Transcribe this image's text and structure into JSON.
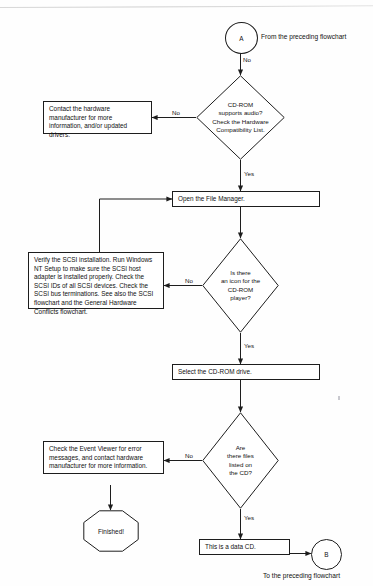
{
  "diagram": {
    "type": "flowchart",
    "ink_color": "#1d1d1d",
    "page_color": "#fefefe"
  },
  "connectors": {
    "entry": {
      "label": "A",
      "caption": "From the preceding flowchart"
    },
    "exit": {
      "label": "B",
      "caption": "To the preceding flowchart"
    }
  },
  "decisions": {
    "audio_support": {
      "lines": [
        "CD-ROM",
        "supports audio?",
        "Check the Hardware",
        "Compatibility List."
      ],
      "no_label": "No",
      "yes_label": "Yes"
    },
    "icon_present": {
      "lines": [
        "Is there",
        "an icon for the",
        "CD-ROM",
        "player?"
      ],
      "no_label": "No",
      "yes_label": "Yes"
    },
    "files_listed": {
      "lines": [
        "Are",
        "there files",
        "listed on",
        "the CD?"
      ],
      "no_label": "No",
      "yes_label": "Yes"
    }
  },
  "processes": {
    "contact_manufacturer": "Contact the hardware manufacturer for more information, and/or updated drivers.",
    "open_file_manager": "Open the File Manager.",
    "verify_scsi": "Verify the SCSI installation. Run Windows NT Setup to make sure the SCSI host adapter is installed properly. Check the SCSI IDs of all SCSI devices. Check the SCSI bus terminations. See also the SCSI flowchart and the General Hardware Conflicts flowchart.",
    "select_drive": "Select the CD-ROM drive.",
    "check_event_viewer": "Check the Event Viewer for error messages, and contact hardware manufacturer for more information.",
    "data_cd": "This is a data CD."
  },
  "terminals": {
    "finished": "Finished!"
  },
  "edge_labels": {
    "entry_no": "No"
  }
}
